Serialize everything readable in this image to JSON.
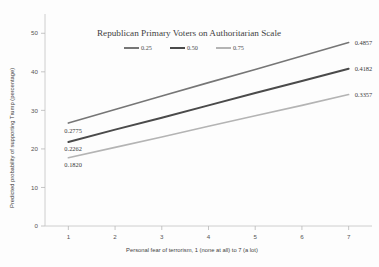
{
  "chart_data": {
    "type": "line",
    "title": "Republican Primary Voters on Authoritarian Scale",
    "xlabel": "Personal fear of terrorism, 1 (none at all) to 7 (a lot)",
    "ylabel": "Predicted probability of supporting Trump (percentage)",
    "x": [
      1,
      2,
      3,
      4,
      5,
      6,
      7
    ],
    "xlim": [
      0.5,
      7.5
    ],
    "ylim": [
      0,
      55
    ],
    "xticks": [
      "1",
      "2",
      "3",
      "4",
      "5",
      "6",
      "7"
    ],
    "yticks": [
      "0",
      "10",
      "20",
      "30",
      "40",
      "50"
    ],
    "ytick_values": [
      0,
      10,
      20,
      30,
      40,
      50
    ],
    "grid": false,
    "legend_position": "top-center",
    "legend_title": "",
    "series": [
      {
        "name": "0.25",
        "color": "#767676",
        "start_value": 26.7,
        "end_value": 47.6,
        "values": [
          26.7,
          30.2,
          33.7,
          37.2,
          40.6,
          44.1,
          47.6
        ],
        "start_label": "0.2775",
        "end_label": "0.4857"
      },
      {
        "name": "0.50",
        "color": "#4a4a4a",
        "start_value": 21.8,
        "end_value": 40.8,
        "values": [
          21.8,
          25.0,
          28.1,
          31.3,
          34.5,
          37.6,
          40.8
        ],
        "start_label": "0.2262",
        "end_label": "0.4182"
      },
      {
        "name": "0.75",
        "color": "#b4b4b4",
        "start_value": 17.7,
        "end_value": 34.1,
        "values": [
          17.7,
          20.4,
          23.1,
          25.9,
          28.6,
          31.3,
          34.1
        ],
        "start_label": "0.1820",
        "end_label": "0.3357"
      }
    ]
  },
  "colors": {
    "background": "#fdfdfd",
    "axis": "#c8c8c8",
    "text": "#4a4a4a"
  }
}
